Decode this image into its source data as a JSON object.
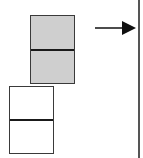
{
  "diagram": {
    "type": "block-transfer",
    "blocks": [
      {
        "id": "upper-block",
        "fill": "#cfcfcf",
        "x": 30,
        "y": 15,
        "w": 45,
        "h": 69,
        "divider_y": 34
      },
      {
        "id": "lower-block",
        "fill": "#ffffff",
        "x": 9,
        "y": 86,
        "w": 45,
        "h": 68,
        "divider_y": 33
      }
    ],
    "arrow": {
      "direction": "right",
      "x1": 95,
      "x2": 136,
      "y": 28,
      "color": "#111111"
    },
    "wall": {
      "x": 138,
      "color": "#555555"
    }
  }
}
